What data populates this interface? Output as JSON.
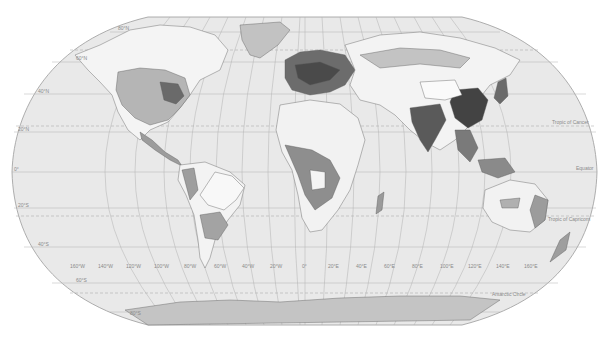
{
  "map": {
    "projection": "Robinson",
    "colors": {
      "background": "#ffffff",
      "ocean": "#e9e9e9",
      "outline": "#9a9a9a",
      "graticule": "#a8a8a8",
      "land_light": "#f6f6f6",
      "land_mid": "#b9b9b9",
      "land_medium_dark": "#8c8c8c",
      "land_dark": "#5e5e5e",
      "land_darkest": "#3c3c3c",
      "antarctica": "#c4c4c4",
      "label": "#8a8a8a"
    },
    "latitude_labels": [
      "80°N",
      "60°N",
      "40°N",
      "20°N",
      "0°",
      "20°S",
      "40°S",
      "60°S",
      "80°S"
    ],
    "longitude_labels": [
      "160°W",
      "140°W",
      "120°W",
      "100°W",
      "80°W",
      "60°W",
      "40°W",
      "20°W",
      "0°",
      "20°E",
      "40°E",
      "60°E",
      "80°E",
      "100°E",
      "120°E",
      "140°E",
      "160°E"
    ],
    "special_lines": {
      "tropic_of_cancer": "Tropic of Cancer",
      "equator": "Equator",
      "tropic_of_capricorn": "Tropic of Capricorn",
      "antarctic_circle": "Antarctic Circle",
      "arctic_circle": "Arctic Circle"
    }
  }
}
